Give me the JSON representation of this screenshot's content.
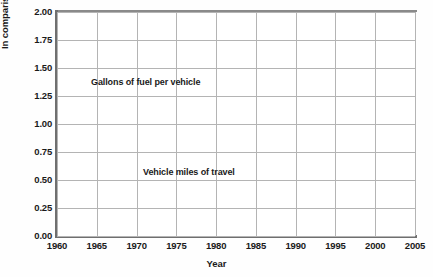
{
  "axis": {
    "ylabel": "In comparison to 1987 data",
    "xlabel": "Year",
    "yticks": [
      "2.00",
      "1.75",
      "1.50",
      "1.25",
      "1.00",
      "0.75",
      "0.50",
      "0.25",
      "0.00"
    ],
    "xticks": [
      "1960",
      "1965",
      "1970",
      "1975",
      "1980",
      "1985",
      "1990",
      "1995",
      "2000",
      "2005"
    ]
  },
  "annotations": {
    "fuel": "Gallons of fuel per vehicle",
    "vmt": "Vehicle miles of travel"
  },
  "colors": {
    "line": "#4a4a4a",
    "grid": "#b4b4b4",
    "axis": "#6f6f6f",
    "text": "#1a1a1a",
    "background": "#ffffff"
  },
  "chart_data": {
    "type": "line",
    "title": "",
    "xlabel": "Year",
    "ylabel": "In comparison to 1987 data",
    "xlim": [
      1960,
      2005
    ],
    "ylim": [
      0.0,
      2.0
    ],
    "ytick_step": 0.25,
    "xtick_step": 5,
    "grid": true,
    "legend": "inline-annotations",
    "x": [
      1960,
      1961,
      1962,
      1963,
      1964,
      1965,
      1966,
      1967,
      1968,
      1969,
      1970,
      1971,
      1972,
      1973,
      1974,
      1975,
      1976,
      1977,
      1978,
      1979,
      1980,
      1981,
      1982,
      1983,
      1984,
      1985,
      1986,
      1987,
      1988,
      1989,
      1990,
      1991,
      1992,
      1993,
      1994,
      1995,
      1996,
      1997,
      1998,
      1999,
      2000,
      2001,
      2002,
      2003,
      2004,
      2005
    ],
    "series": [
      {
        "name": "Gallons of fuel per vehicle",
        "values": [
          1.11,
          1.1,
          1.1,
          1.1,
          1.1,
          1.11,
          1.12,
          1.13,
          1.15,
          1.17,
          1.19,
          1.21,
          1.23,
          1.25,
          1.21,
          1.16,
          1.16,
          1.17,
          1.19,
          1.2,
          1.18,
          1.12,
          1.07,
          1.05,
          1.04,
          1.03,
          1.03,
          1.0,
          0.99,
          0.98,
          0.98,
          0.97,
          0.98,
          0.99,
          1.0,
          1.01,
          1.02,
          1.02,
          1.03,
          1.04,
          1.04,
          1.03,
          1.06,
          1.04,
          1.05,
          1.05
        ]
      },
      {
        "name": "Vehicle miles of travel",
        "values": [
          0.38,
          0.4,
          0.42,
          0.44,
          0.46,
          0.48,
          0.5,
          0.52,
          0.54,
          0.56,
          0.58,
          0.61,
          0.64,
          0.67,
          0.66,
          0.68,
          0.71,
          0.74,
          0.78,
          0.8,
          0.8,
          0.81,
          0.83,
          0.86,
          0.9,
          0.94,
          0.97,
          1.0,
          1.04,
          1.08,
          1.11,
          1.13,
          1.17,
          1.2,
          1.24,
          1.27,
          1.3,
          1.33,
          1.37,
          1.4,
          1.43,
          1.45,
          1.49,
          1.5,
          1.53,
          1.56
        ]
      }
    ]
  }
}
